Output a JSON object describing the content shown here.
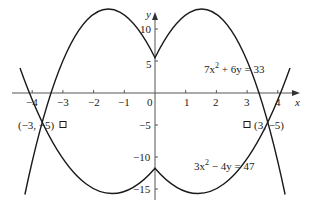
{
  "diagram": {
    "title": "",
    "axes": {
      "x_label": "x",
      "y_label": "y",
      "x_ticks": [
        "−4",
        "−3",
        "−2",
        "−1",
        "0",
        "1",
        "2",
        "3",
        "4"
      ],
      "y_ticks": [
        "10",
        "5",
        "−5",
        "−10",
        "−15"
      ]
    },
    "curves": [
      {
        "name": "upper-parabola",
        "equation": "7x² + 6y = 33",
        "eq_main": "7x",
        "eq_sup": "2",
        "eq_rest": " + 6y = 33"
      },
      {
        "name": "lower-parabola",
        "equation": "3x² − 4y = 47",
        "eq_main": "3x",
        "eq_sup": "2",
        "eq_rest": " − 4y = 47"
      }
    ],
    "intersections": [
      {
        "label": "(−3, −5)",
        "x": -3,
        "y": -5
      },
      {
        "label": "(3, −5)",
        "x": 3,
        "y": -5
      }
    ],
    "colors": {
      "stroke": "#1a1a1a",
      "axis": "#555555",
      "background": "#ffffff"
    }
  }
}
